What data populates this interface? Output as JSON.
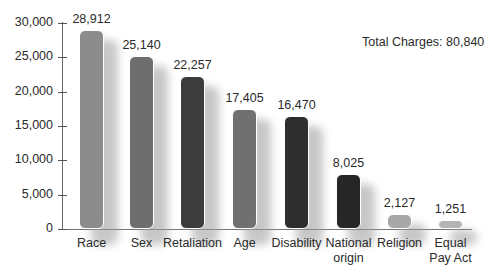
{
  "chart_data": {
    "type": "bar",
    "title": "",
    "xlabel": "",
    "ylabel": "",
    "ylim": [
      0,
      30000
    ],
    "yticks": [
      0,
      5000,
      10000,
      15000,
      20000,
      25000,
      30000
    ],
    "ytick_labels": [
      "0",
      "5,000",
      "10,000",
      "15,000",
      "20,000",
      "25,000",
      "30,000"
    ],
    "grid": false,
    "legend": null,
    "annotation": "Total Charges: 80,840",
    "categories": [
      "Race",
      "Sex",
      "Retaliation",
      "Age",
      "Disability",
      "National origin",
      "Religion",
      "Equal Pay Act"
    ],
    "category_lines": [
      [
        "Race"
      ],
      [
        "Sex"
      ],
      [
        "Retaliation"
      ],
      [
        "Age"
      ],
      [
        "Disability"
      ],
      [
        "National",
        "origin"
      ],
      [
        "Religion"
      ],
      [
        "Equal",
        "Pay Act"
      ]
    ],
    "values": [
      28912,
      25140,
      22257,
      17405,
      16470,
      8025,
      2127,
      1251
    ],
    "value_labels": [
      "28,912",
      "25,140",
      "22,257",
      "17,405",
      "16,470",
      "8,025",
      "2,127",
      "1,251"
    ],
    "colors": [
      "#8c8c8c",
      "#6e6e6e",
      "#3c3c3c",
      "#707070",
      "#2e2e2e",
      "#262626",
      "#a8a8a8",
      "#b4b4b4"
    ]
  },
  "annotation": {
    "total_label": "Total Charges: 80,840"
  }
}
